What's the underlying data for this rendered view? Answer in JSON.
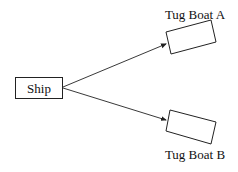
{
  "diagram": {
    "ship": {
      "label": "Ship"
    },
    "tug_a": {
      "label": "Tug Boat A"
    },
    "tug_b": {
      "label": "Tug Boat B"
    },
    "colors": {
      "stroke": "#222222",
      "background": "#ffffff"
    }
  }
}
